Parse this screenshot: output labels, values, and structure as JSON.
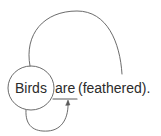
{
  "figure": {
    "background_color": "#ffffff",
    "ink_color": "#5a5a5a",
    "text_color": "#2b2b2b",
    "width": 161,
    "height": 136
  },
  "sentence": {
    "full_text": "Birds are (feathered).",
    "tokens": [
      {
        "id": "subject",
        "text": "Birds",
        "annotation": "circled"
      },
      {
        "id": "copula",
        "text": "are",
        "annotation": "underlined"
      },
      {
        "id": "predicate",
        "text": "(feathered).",
        "annotation": "parenthesized"
      }
    ]
  },
  "annotations": {
    "circle": {
      "label": "circle-around-birds",
      "target": "Birds",
      "center_x": 31,
      "center_y": 88,
      "radius_x": 23,
      "radius_y": 22
    },
    "underline": {
      "label": "underline-under-are",
      "target": "are",
      "x1": 53,
      "y1": 99,
      "x2": 77,
      "y2": 99
    },
    "arc_top": {
      "label": "upper-arc-subject-to-predicate",
      "from": "Birds",
      "to": "(feathered)",
      "start_x": 30,
      "start_y": 66,
      "apex_x": 77,
      "apex_y": 11,
      "end_x": 122,
      "end_y": 74,
      "arrowhead": false
    },
    "arc_bottom": {
      "label": "lower-arc-subject-to-copula",
      "from": "Birds",
      "to": "are",
      "start_x": 26,
      "start_y": 110,
      "low_x": 48,
      "low_y": 131,
      "end_x": 68,
      "end_y": 101,
      "arrowhead": true
    }
  }
}
